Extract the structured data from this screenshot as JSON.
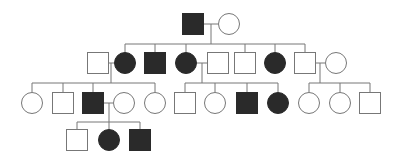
{
  "diagram": {
    "type": "pedigree",
    "colors": {
      "affected": "#2a2a2a",
      "unaffected": "#ffffff",
      "line": "#777777"
    },
    "individuals": [
      {
        "id": "I-1",
        "gen": 1,
        "sex": "male",
        "affected": true,
        "cx": 193,
        "cy": 24
      },
      {
        "id": "I-2",
        "gen": 1,
        "sex": "female",
        "affected": false,
        "cx": 229,
        "cy": 24
      },
      {
        "id": "II-1",
        "gen": 2,
        "sex": "male",
        "affected": false,
        "cx": 98,
        "cy": 63
      },
      {
        "id": "II-2",
        "gen": 2,
        "sex": "female",
        "affected": true,
        "cx": 125,
        "cy": 63
      },
      {
        "id": "II-3",
        "gen": 2,
        "sex": "male",
        "affected": true,
        "cx": 155,
        "cy": 63
      },
      {
        "id": "II-4",
        "gen": 2,
        "sex": "female",
        "affected": true,
        "cx": 186,
        "cy": 63
      },
      {
        "id": "II-5",
        "gen": 2,
        "sex": "male",
        "affected": false,
        "cx": 218,
        "cy": 63
      },
      {
        "id": "II-6",
        "gen": 2,
        "sex": "male",
        "affected": false,
        "cx": 245,
        "cy": 63
      },
      {
        "id": "II-7",
        "gen": 2,
        "sex": "female",
        "affected": true,
        "cx": 275,
        "cy": 63
      },
      {
        "id": "II-8",
        "gen": 2,
        "sex": "male",
        "affected": false,
        "cx": 305,
        "cy": 63
      },
      {
        "id": "II-9",
        "gen": 2,
        "sex": "female",
        "affected": false,
        "cx": 336,
        "cy": 63
      },
      {
        "id": "III-1",
        "gen": 3,
        "sex": "female",
        "affected": false,
        "cx": 32,
        "cy": 103
      },
      {
        "id": "III-2",
        "gen": 3,
        "sex": "male",
        "affected": false,
        "cx": 63,
        "cy": 103
      },
      {
        "id": "III-3",
        "gen": 3,
        "sex": "male",
        "affected": true,
        "cx": 93,
        "cy": 103
      },
      {
        "id": "III-4",
        "gen": 3,
        "sex": "female",
        "affected": false,
        "cx": 124,
        "cy": 103
      },
      {
        "id": "III-5",
        "gen": 3,
        "sex": "female",
        "affected": false,
        "cx": 155,
        "cy": 103
      },
      {
        "id": "III-6",
        "gen": 3,
        "sex": "male",
        "affected": false,
        "cx": 185,
        "cy": 103
      },
      {
        "id": "III-7",
        "gen": 3,
        "sex": "female",
        "affected": false,
        "cx": 215,
        "cy": 103
      },
      {
        "id": "III-8",
        "gen": 3,
        "sex": "male",
        "affected": true,
        "cx": 247,
        "cy": 103
      },
      {
        "id": "III-9",
        "gen": 3,
        "sex": "female",
        "affected": true,
        "cx": 278,
        "cy": 103
      },
      {
        "id": "III-10",
        "gen": 3,
        "sex": "female",
        "affected": false,
        "cx": 309,
        "cy": 103
      },
      {
        "id": "III-11",
        "gen": 3,
        "sex": "female",
        "affected": false,
        "cx": 340,
        "cy": 103
      },
      {
        "id": "III-12",
        "gen": 3,
        "sex": "male",
        "affected": false,
        "cx": 370,
        "cy": 103
      },
      {
        "id": "IV-1",
        "gen": 4,
        "sex": "male",
        "affected": false,
        "cx": 77,
        "cy": 140
      },
      {
        "id": "IV-2",
        "gen": 4,
        "sex": "female",
        "affected": true,
        "cx": 109,
        "cy": 140
      },
      {
        "id": "IV-3",
        "gen": 4,
        "sex": "male",
        "affected": true,
        "cx": 140,
        "cy": 140
      }
    ],
    "lines": [
      [
        204,
        24,
        218,
        24
      ],
      [
        211,
        24,
        211,
        44
      ],
      [
        125,
        44,
        305,
        44
      ],
      [
        125,
        44,
        125,
        52
      ],
      [
        155,
        44,
        155,
        53
      ],
      [
        186,
        44,
        186,
        52
      ],
      [
        245,
        44,
        245,
        53
      ],
      [
        275,
        44,
        275,
        52
      ],
      [
        305,
        44,
        305,
        53
      ],
      [
        109,
        63,
        114,
        63
      ],
      [
        111,
        63,
        111,
        83
      ],
      [
        32,
        83,
        155,
        83
      ],
      [
        32,
        83,
        32,
        92
      ],
      [
        63,
        83,
        63,
        93
      ],
      [
        93,
        83,
        93,
        93
      ],
      [
        155,
        83,
        155,
        92
      ],
      [
        197,
        63,
        207,
        63
      ],
      [
        202,
        63,
        202,
        83
      ],
      [
        185,
        83,
        278,
        83
      ],
      [
        185,
        83,
        185,
        93
      ],
      [
        215,
        83,
        215,
        92
      ],
      [
        247,
        83,
        247,
        93
      ],
      [
        278,
        83,
        278,
        92
      ],
      [
        316,
        63,
        325,
        63
      ],
      [
        320,
        63,
        320,
        83
      ],
      [
        309,
        83,
        370,
        83
      ],
      [
        309,
        83,
        309,
        92
      ],
      [
        340,
        83,
        340,
        92
      ],
      [
        370,
        83,
        370,
        93
      ],
      [
        104,
        103,
        113,
        103
      ],
      [
        109,
        103,
        109,
        122
      ],
      [
        77,
        122,
        140,
        122
      ],
      [
        77,
        122,
        77,
        130
      ],
      [
        109,
        122,
        109,
        129
      ],
      [
        140,
        122,
        140,
        130
      ]
    ]
  }
}
